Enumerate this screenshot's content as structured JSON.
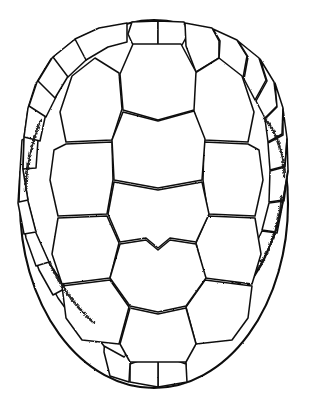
{
  "figure": {
    "caption": "",
    "style": "stippled line engraving",
    "colors": {
      "background": "#ffffff",
      "ink": "#111111",
      "fill": "#ffffff",
      "stipple": "#171717"
    },
    "canvas": {
      "width": 311,
      "height": 410
    },
    "outline": {
      "name": "carapace-outline",
      "shape": "oval",
      "cx": 154,
      "cy": 204,
      "rx": 134,
      "ry": 184,
      "bounds": {
        "left": 20,
        "top": 20,
        "right": 288,
        "bottom": 388
      }
    },
    "counts": {
      "vertebral_scutes": 5,
      "pleural_scutes_per_side": 4,
      "pleural_scutes_total": 8,
      "marginal_scutes": 24
    },
    "groups": [
      {
        "key": "vertebral",
        "label": "Vertebral scutes",
        "count": 5
      },
      {
        "key": "pleural",
        "label": "Pleural (costal) scutes",
        "count": 8
      },
      {
        "key": "marginal",
        "label": "Marginal scutes",
        "count": 24
      }
    ],
    "vertebral": [
      {
        "id": "V1",
        "label": "Vertebral 1",
        "d": "M 133 44 L 181 44 L 196 72 L 194 110 L 158 120 L 123 110 L 120 74 Z"
      },
      {
        "id": "V2",
        "label": "Vertebral 2",
        "d": "M 123 112 L 158 121 L 194 111 L 205 139 L 202 180 L 158 188 L 114 180 L 112 140 Z"
      },
      {
        "id": "V3",
        "label": "Vertebral 3",
        "d": "M 114 182 L 158 190 L 202 182 L 209 214 L 196 242 L 170 238 L 158 248 L 146 238 L 120 242 L 108 214 Z"
      },
      {
        "id": "V4",
        "label": "Vertebral 4",
        "d": "M 120 244 L 146 240 L 158 250 L 170 240 L 196 244 L 206 278 L 186 306 L 158 312 L 130 306 L 110 278 Z"
      },
      {
        "id": "V5",
        "label": "Vertebral 5",
        "d": "M 130 308 L 158 314 L 186 308 L 196 344 L 186 362 L 130 362 L 120 344 Z"
      }
    ],
    "pleural_left": [
      {
        "id": "L1",
        "label": "Left pleural 1",
        "d": "M 119 73 L 122 109 L 112 140 L 66 142 L 60 112 L 72 76 L 95 58 Z"
      },
      {
        "id": "L2",
        "label": "Left pleural 2",
        "d": "M 66 144 L 112 142 L 113 180 L 107 214 L 58 216 L 50 180 L 54 150 Z"
      },
      {
        "id": "L3",
        "label": "Left pleural 3",
        "d": "M 58 218 L 107 216 L 119 243 L 110 278 L 62 284 L 52 254 Z"
      },
      {
        "id": "L4",
        "label": "Left pleural 4",
        "d": "M 62 286 L 110 280 L 129 307 L 119 344 L 82 340 L 66 318 Z"
      }
    ],
    "pleural_right": [
      {
        "id": "R1",
        "label": "Right pleural 1",
        "d": "M 195 73 L 193 109 L 204 140 L 248 142 L 254 112 L 242 76 L 219 58 Z"
      },
      {
        "id": "R2",
        "label": "Right pleural 2",
        "d": "M 248 144 L 204 142 L 203 180 L 208 214 L 255 216 L 263 180 L 259 150 Z"
      },
      {
        "id": "R3",
        "label": "Right pleural 3",
        "d": "M 255 218 L 208 216 L 196 243 L 205 278 L 252 284 L 261 254 Z"
      },
      {
        "id": "R4",
        "label": "Right pleural 4",
        "d": "M 252 286 L 205 280 L 186 307 L 196 344 L 232 340 L 248 318 Z"
      }
    ],
    "marginal": [
      {
        "id": "M1",
        "label": "Marginal 1",
        "d": "M 132 22 L 158 21 L 158 45 L 133 45 L 128 34 Z"
      },
      {
        "id": "M2",
        "label": "Marginal 2",
        "d": "M 158 21 L 184 22 L 188 34 L 182 45 L 158 45 Z"
      },
      {
        "id": "M3",
        "label": "Marginal 3",
        "d": "M 185 23 L 212 28 L 219 41 L 219 58 L 196 72 L 186 46 Z"
      },
      {
        "id": "M4",
        "label": "Marginal 4",
        "d": "M 213 29 L 237 40 L 247 56 L 243 78 L 219 59 L 220 41 Z"
      },
      {
        "id": "M5",
        "label": "Marginal 5",
        "d": "M 238 41 L 259 58 L 266 80 L 255 100 L 244 79 L 248 57 Z"
      },
      {
        "id": "M6",
        "label": "Marginal 6",
        "d": "M 260 59 L 274 82 L 277 106 L 265 118 L 256 101 L 267 81 Z"
      },
      {
        "id": "M7",
        "label": "Marginal 7",
        "d": "M 275 83 L 283 108 L 282 134 L 268 142 L 265 119 L 277 107 Z"
      },
      {
        "id": "M8",
        "label": "Marginal 8",
        "d": "M 283 109 L 287 138 L 285 166 L 270 170 L 268 143 L 283 135 Z"
      },
      {
        "id": "M9",
        "label": "Marginal 9",
        "d": "M 287 139 L 288 170 L 283 200 L 269 202 L 270 171 L 285 167 Z"
      },
      {
        "id": "M10",
        "label": "Marginal 10",
        "d": "M 288 171 L 283 201 L 276 232 L 262 230 L 269 203 L 284 201 Z"
      },
      {
        "id": "M11",
        "label": "Marginal 11",
        "d": "M 283 202 L 275 233 L 263 262 L 250 256 L 262 231 L 277 233 Z"
      },
      {
        "id": "M12",
        "label": "Marginal 12",
        "d": "M 275 234 L 262 263 L 246 288 L 234 280 L 250 257 L 263 262 Z"
      },
      {
        "id": "M13",
        "label": "Marginal 13",
        "d": "M 262 264 L 245 289 L 226 310 L 216 299 L 234 281 L 247 288 Z"
      },
      {
        "id": "M14",
        "label": "Marginal 14",
        "d": "M 245 290 L 226 311 L 204 330 L 196 316 L 216 300 L 227 310 Z"
      },
      {
        "id": "M15",
        "label": "Marginal 15",
        "d": "M 226 312 L 203 331 L 180 345 L 176 330 L 196 317 L 205 330 Z"
      },
      {
        "id": "M16",
        "label": "Marginal 16",
        "d": "M 203 332 L 181 346 L 186 363 L 186 382 L 166 378 L 163 352 L 177 331 Z"
      },
      {
        "id": "M17",
        "label": "Marginal 17",
        "d": "M 158 354 L 186 364 L 187 382 L 158 387 Z"
      },
      {
        "id": "M18",
        "label": "Marginal 18",
        "d": "M 130 364 L 158 354 L 158 387 L 130 382 Z"
      },
      {
        "id": "M19",
        "label": "Marginal 19",
        "d": "M 105 332 L 131 347 L 130 364 L 129 382 L 110 376 L 104 352 Z"
      },
      {
        "id": "M20",
        "label": "Marginal 20",
        "d": "M 86 312 L 108 331 L 131 346 L 124 357 L 104 346 L 90 328 Z"
      },
      {
        "id": "M21",
        "label": "Marginal 21",
        "d": "M 66 290 L 86 311 L 108 330 L 96 342 L 78 324 L 64 303 Z"
      },
      {
        "id": "M22",
        "label": "Marginal 22",
        "d": "M 49 264 L 66 289 L 86 310 L 74 320 L 58 298 L 46 276 Z"
      },
      {
        "id": "M23",
        "label": "Marginal 23",
        "d": "M 36 234 L 49 263 L 66 288 L 53 295 L 39 270 L 30 244 Z"
      },
      {
        "id": "M24",
        "label": "Marginal 24",
        "d": "M 28 202 L 36 233 L 49 262 L 36 266 L 26 238 L 21 208 Z"
      },
      {
        "id": "M25",
        "label": "Marginal 25",
        "d": "M 23 171 L 28 201 L 36 232 L 24 234 L 18 203 L 20 172 Z"
      },
      {
        "id": "M26",
        "label": "Marginal 26",
        "d": "M 24 139 L 23 170 L 28 200 L 19 202 L 20 171 L 22 140 Z"
      },
      {
        "id": "M27",
        "label": "Marginal 27",
        "d": "M 28 109 L 24 138 L 23 169 L 36 168 L 38 140 L 40 120 Z"
      },
      {
        "id": "M28",
        "label": "Marginal 28",
        "d": "M 36 83 L 28 108 L 24 137 L 40 141 L 46 113 L 48 92 Z"
      },
      {
        "id": "M29",
        "label": "Marginal 29",
        "d": "M 51 59 L 37 82 L 29 106 L 46 117 L 56 97 L 62 75 Z"
      },
      {
        "id": "M30",
        "label": "Marginal 30",
        "d": "M 73 41 L 52 58 L 38 81 L 55 98 L 67 78 L 78 59 Z"
      },
      {
        "id": "M31",
        "label": "Marginal 31",
        "d": "M 98 29 L 74 40 L 53 57 L 68 77 L 85 61 L 101 46 Z"
      },
      {
        "id": "M32",
        "label": "Marginal 32",
        "d": "M 127 23 L 99 28 L 75 39 L 86 60 L 108 47 L 127 42 Z"
      }
    ],
    "stipple_accents": [
      {
        "id": "S1",
        "d": "M 264 118 C 277 132 283 154 284 176"
      },
      {
        "id": "S2",
        "d": "M 281 196 C 279 222 271 246 258 268"
      },
      {
        "id": "S3",
        "d": "M 40 120 C 31 142 26 166 25 190"
      },
      {
        "id": "S4",
        "d": "M 49 262 C 60 286 75 306 93 322"
      }
    ]
  }
}
